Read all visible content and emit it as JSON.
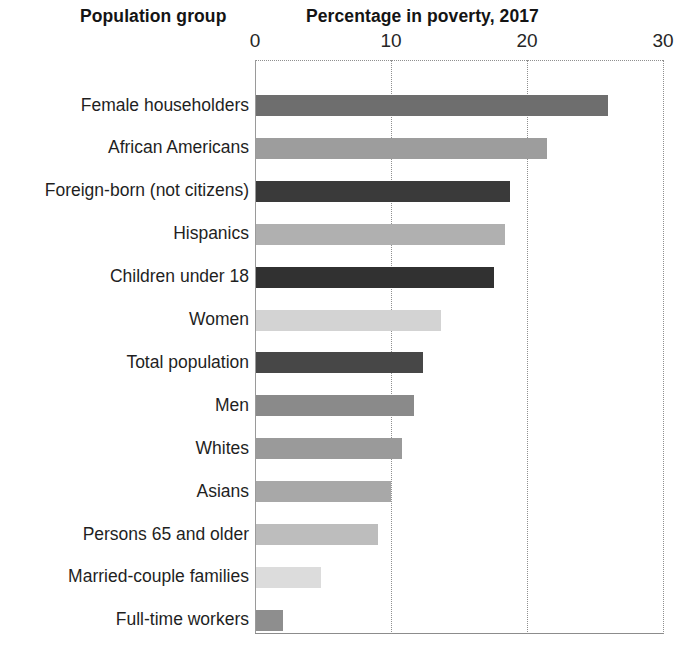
{
  "headings": {
    "group": "Population group",
    "value": "Percentage in poverty, 2017"
  },
  "chart_data": {
    "type": "bar",
    "orientation": "horizontal",
    "title": "Percentage in poverty, 2017",
    "xlabel": "Percentage in poverty, 2017",
    "ylabel": "Population group",
    "xlim": [
      0,
      30
    ],
    "ticks": [
      0,
      10,
      20,
      30
    ],
    "tick_labels": [
      "0",
      "10",
      "20",
      "30"
    ],
    "grid": "vertical-dotted",
    "legend": "none",
    "categories": [
      "Female householders",
      "African Americans",
      "Foreign-born (not citizens)",
      "Hispanics",
      "Children under 18",
      "Women",
      "Total population",
      "Men",
      "Whites",
      "Asians",
      "Persons 65 and older",
      "Married-couple families",
      "Full-time workers"
    ],
    "values": [
      25.9,
      21.4,
      18.7,
      18.3,
      17.5,
      13.6,
      12.3,
      11.6,
      10.7,
      9.9,
      9.0,
      4.8,
      2.0
    ],
    "colors": [
      "#6e6e6e",
      "#9d9d9d",
      "#3a3a3a",
      "#b0b0b0",
      "#313131",
      "#d3d3d3",
      "#474747",
      "#8a8a8a",
      "#9a9a9a",
      "#a8a8a8",
      "#bdbdbd",
      "#dcdcdc",
      "#8e8e8e"
    ]
  }
}
